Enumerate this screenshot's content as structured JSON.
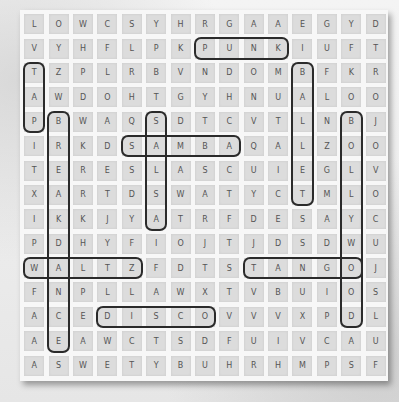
{
  "puzzle": {
    "rows": [
      "LOWCSYHRGAAEGYD",
      "VYHFLPKPUNKIUFT",
      "TZPLRBVNDOMBFKR",
      "AWDOHTGYHNUALOO",
      "PBWAQSDTCVTLNBJ",
      "IRKDSAMBAQALZOO",
      "TERESLASCUIEGLV",
      "XARTDSWATYCTMLO",
      "IKKJYATRFDESAYC",
      "PDHYFIOJTJDSDWU",
      "WALTZFDTSTANGOJ",
      "FNPLLAWXTVBUIOS",
      "ACEDISCOVVVXPDL",
      "AEAWCTSDFUIVCAU",
      "ASWETYBUHRHMPSF"
    ],
    "found_words": [
      {
        "word": "PUNK",
        "row": 1,
        "col": 7,
        "dir": "h",
        "len": 4
      },
      {
        "word": "TAP",
        "row": 2,
        "col": 0,
        "dir": "v",
        "len": 3
      },
      {
        "word": "BALLET",
        "row": 2,
        "col": 11,
        "dir": "v",
        "len": 6
      },
      {
        "word": "BREAKDANCE",
        "row": 4,
        "col": 1,
        "dir": "v",
        "len": 10
      },
      {
        "word": "SALSA",
        "row": 4,
        "col": 5,
        "dir": "v",
        "len": 5
      },
      {
        "word": "BOLLYWOOD",
        "row": 4,
        "col": 13,
        "dir": "v",
        "len": 9
      },
      {
        "word": "SAMBA",
        "row": 5,
        "col": 4,
        "dir": "h",
        "len": 5
      },
      {
        "word": "WALTZ",
        "row": 10,
        "col": 0,
        "dir": "h",
        "len": 5
      },
      {
        "word": "TANGO",
        "row": 10,
        "col": 9,
        "dir": "h",
        "len": 5
      },
      {
        "word": "DISCO",
        "row": 12,
        "col": 3,
        "dir": "h",
        "len": 5
      }
    ],
    "ring_color": "#2b2b2b",
    "cell_color": "#dcdcdc",
    "letter_color": "#555555"
  }
}
